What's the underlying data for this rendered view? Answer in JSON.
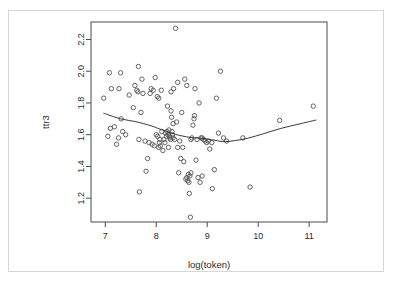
{
  "figure": {
    "frame_color": "#d7d7d7",
    "background": "#ffffff",
    "axis_color": "#4a4a4a",
    "point_color": "#555555",
    "curve_color": "#3a3a3a"
  },
  "chart_data": {
    "type": "scatter",
    "title": "",
    "xlabel": "log(token)",
    "ylabel": "ttr3",
    "xlim": [
      6.72,
      11.35
    ],
    "ylim": [
      1.05,
      2.31
    ],
    "xticks": [
      7,
      8,
      9,
      10,
      11
    ],
    "xtick_labels": [
      "7",
      "8",
      "9",
      "10",
      "11"
    ],
    "yticks": [
      2.2,
      2.0,
      1.8,
      1.6,
      1.4,
      1.2
    ],
    "ytick_labels": [
      "2.2",
      "2.0",
      "1.8",
      "1.6",
      "1.4",
      "1.2"
    ],
    "grid": false,
    "legend": "none",
    "marker": "open-circle",
    "x": [
      6.97,
      7.08,
      7.12,
      7.05,
      7.1,
      7.18,
      7.22,
      7.27,
      7.31,
      7.34,
      7.3,
      7.26,
      7.4,
      7.47,
      7.55,
      7.58,
      7.62,
      7.65,
      7.67,
      7.7,
      7.72,
      7.66,
      7.74,
      7.78,
      7.8,
      7.83,
      7.86,
      7.88,
      7.9,
      7.92,
      7.94,
      7.96,
      7.98,
      8.0,
      8.02,
      8.03,
      8.05,
      8.06,
      8.07,
      8.08,
      8.1,
      8.11,
      8.13,
      8.15,
      8.17,
      8.18,
      8.2,
      8.21,
      8.22,
      8.23,
      8.24,
      8.25,
      8.26,
      8.27,
      8.28,
      8.29,
      8.3,
      8.31,
      8.32,
      8.33,
      8.34,
      8.36,
      8.38,
      8.4,
      8.42,
      8.44,
      8.46,
      8.48,
      8.5,
      8.52,
      8.54,
      8.56,
      8.58,
      8.6,
      8.62,
      8.63,
      8.64,
      8.65,
      8.66,
      8.67,
      8.68,
      8.7,
      8.72,
      8.74,
      8.76,
      8.78,
      8.8,
      8.82,
      8.84,
      8.86,
      8.88,
      8.9,
      8.93,
      8.96,
      8.99,
      9.02,
      9.05,
      9.1,
      9.14,
      9.18,
      9.22,
      9.26,
      9.32,
      9.38,
      9.7,
      9.84,
      10.42,
      11.08,
      8.42,
      8.68,
      7.64,
      8.05,
      8.29,
      8.33,
      8.6,
      8.75,
      8.9,
      9.09
    ],
    "y": [
      1.83,
      1.99,
      1.89,
      1.59,
      1.64,
      1.65,
      1.54,
      1.89,
      1.7,
      1.62,
      1.99,
      1.58,
      1.6,
      1.85,
      1.77,
      1.91,
      1.88,
      2.03,
      1.24,
      1.74,
      1.95,
      1.57,
      1.86,
      1.56,
      1.37,
      1.45,
      1.55,
      1.86,
      1.89,
      1.54,
      1.88,
      1.53,
      1.96,
      1.6,
      1.84,
      1.59,
      1.52,
      1.55,
      1.57,
      1.53,
      1.88,
      1.62,
      1.5,
      1.57,
      1.55,
      1.61,
      1.59,
      1.62,
      1.78,
      1.6,
      1.52,
      1.63,
      1.59,
      1.58,
      1.57,
      1.75,
      1.71,
      1.62,
      1.6,
      1.58,
      1.89,
      1.57,
      2.27,
      1.68,
      1.52,
      1.36,
      1.56,
      1.45,
      1.74,
      1.52,
      1.43,
      1.95,
      1.32,
      1.33,
      1.31,
      1.35,
      1.3,
      1.23,
      1.34,
      1.08,
      1.57,
      1.58,
      1.66,
      1.7,
      1.89,
      1.44,
      1.57,
      1.33,
      1.8,
      1.3,
      1.58,
      1.34,
      1.57,
      1.56,
      1.55,
      1.56,
      1.51,
      1.26,
      1.38,
      1.83,
      1.61,
      2.0,
      1.58,
      1.56,
      1.58,
      1.27,
      1.69,
      1.78,
      1.93,
      1.36,
      1.87,
      1.83,
      1.87,
      1.67,
      1.91,
      1.72,
      1.58,
      1.55
    ],
    "smoother": {
      "type": "loess",
      "x": [
        6.97,
        7.3,
        7.6,
        7.9,
        8.1,
        8.3,
        8.45,
        8.6,
        8.75,
        8.9,
        9.05,
        9.2,
        9.35,
        9.55,
        9.8,
        10.1,
        10.45,
        10.8,
        11.13
      ],
      "y": [
        1.735,
        1.7,
        1.682,
        1.656,
        1.632,
        1.61,
        1.596,
        1.586,
        1.58,
        1.577,
        1.57,
        1.562,
        1.556,
        1.563,
        1.578,
        1.606,
        1.64,
        1.667,
        1.692
      ]
    }
  }
}
